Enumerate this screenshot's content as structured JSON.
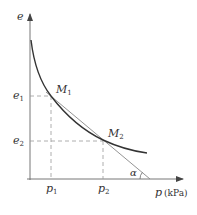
{
  "diagram": {
    "type": "e-p compression curve",
    "y_axis_label": "e",
    "x_axis_label": "p",
    "x_axis_unit": "(kPa)",
    "points": [
      {
        "name": "M",
        "sub": "1"
      },
      {
        "name": "M",
        "sub": "2"
      }
    ],
    "y_ticks": [
      {
        "name": "e",
        "sub": "1"
      },
      {
        "name": "e",
        "sub": "2"
      }
    ],
    "x_ticks": [
      {
        "name": "p",
        "sub": "1"
      },
      {
        "name": "p",
        "sub": "2"
      }
    ],
    "angle_label": "α",
    "colors": {
      "axis": "#555555",
      "curve": "#333333",
      "secant": "#888888",
      "dashed": "#999999",
      "text": "#333333"
    }
  }
}
